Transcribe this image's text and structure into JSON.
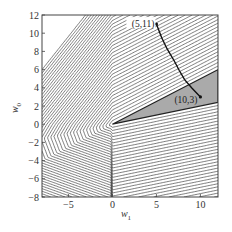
{
  "chart_data": {
    "type": "contour",
    "title": "",
    "xlabel": "w",
    "xlabel_sub": "1",
    "ylabel": "w",
    "ylabel_sub": "0",
    "xlim": [
      -8,
      12
    ],
    "ylim": [
      -8,
      12
    ],
    "xticks": [
      -5,
      0,
      5,
      10
    ],
    "yticks": [
      -8,
      -6,
      -4,
      -2,
      0,
      2,
      4,
      6,
      8,
      10,
      12
    ],
    "grid": false,
    "legend": "none",
    "contour_levels": 20,
    "contour_color": "#444444",
    "feasible_region": {
      "vertex": [
        0,
        0
      ],
      "upper_slope": 0.5,
      "lower_slope": 0.2,
      "fill": "#aaaaaa"
    },
    "path": {
      "points": [
        [
          5,
          11
        ],
        [
          5.6,
          9.5
        ],
        [
          6.2,
          8.3
        ],
        [
          7.0,
          7.0
        ],
        [
          7.6,
          5.9
        ],
        [
          8.2,
          4.9
        ],
        [
          9.0,
          4.0
        ],
        [
          10,
          3
        ]
      ],
      "color": "#111111"
    },
    "annotations": [
      {
        "text": "(5,11)",
        "x": 5,
        "y": 11
      },
      {
        "text": "(10,3)",
        "x": 10,
        "y": 3
      }
    ]
  }
}
